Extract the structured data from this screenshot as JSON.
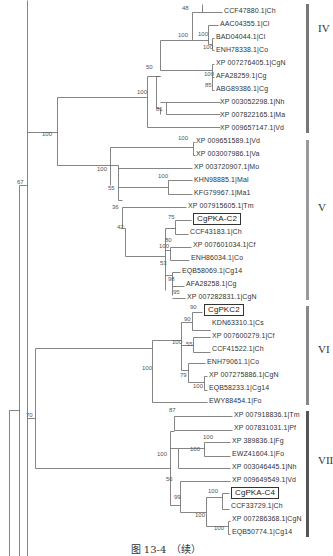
{
  "figure": {
    "caption": "图 13-4　（续）",
    "line_color": "#666666"
  },
  "leaves": [
    {
      "label": "CCF47880.1|Ch",
      "x": 224,
      "y": 10
    },
    {
      "label": "AAC04355.1|Cl",
      "x": 220,
      "y": 23
    },
    {
      "label": "BAD04044.1|Cl",
      "x": 216,
      "y": 36
    },
    {
      "label": "ENH78338.1|Co",
      "x": 216,
      "y": 49
    },
    {
      "label": "XP 007276405.1|CgN",
      "x": 216,
      "y": 62
    },
    {
      "label": "AFA28259.1|Cg",
      "x": 216,
      "y": 75
    },
    {
      "label": "ABG89386.1|Cg",
      "x": 216,
      "y": 88
    },
    {
      "label": "XP 003052298.1|Nh",
      "x": 220,
      "y": 101
    },
    {
      "label": "XP 007822165.1|Ma",
      "x": 220,
      "y": 114
    },
    {
      "label": "XP 009657147.1|Vd",
      "x": 220,
      "y": 127
    },
    {
      "label": "XP 009651589.1|Vd",
      "x": 196,
      "y": 140
    },
    {
      "label": "XP 003007986.1|Va",
      "x": 196,
      "y": 153
    },
    {
      "label": "XP 003720907.1|Mo",
      "x": 194,
      "y": 166
    },
    {
      "label": "KHN98885.1|Mal",
      "x": 194,
      "y": 179
    },
    {
      "label": "KFG79967.1|Ma1",
      "x": 194,
      "y": 192
    },
    {
      "label": "XP 007915605.1|Tm",
      "x": 188,
      "y": 205
    },
    {
      "label": "CgPKA-C2",
      "x": 193,
      "y": 217,
      "boxed": true
    },
    {
      "label": "CCF43183.1|Ch",
      "x": 190,
      "y": 231
    },
    {
      "label": "XP 007601034.1|Cf",
      "x": 193,
      "y": 244
    },
    {
      "label": "ENH86034.1|Co",
      "x": 191,
      "y": 257
    },
    {
      "label": "EQB58069.1|Cg14",
      "x": 182,
      "y": 270
    },
    {
      "label": "AFA28258.1|Cg",
      "x": 186,
      "y": 283
    },
    {
      "label": "XP 007282831.1|CgN",
      "x": 187,
      "y": 296
    },
    {
      "label": "CgPKC2",
      "x": 204,
      "y": 308,
      "boxed": true
    },
    {
      "label": "KDN63310.1|Cs",
      "x": 212,
      "y": 322
    },
    {
      "label": "XP 007600279.1|Cf",
      "x": 212,
      "y": 335
    },
    {
      "label": "CCF41522.1|Ch",
      "x": 212,
      "y": 348
    },
    {
      "label": "ENH79061.1|Co",
      "x": 207,
      "y": 361
    },
    {
      "label": "XP 007275886.1|CgN",
      "x": 209,
      "y": 374
    },
    {
      "label": "EQB58233.1|Cg14",
      "x": 209,
      "y": 387
    },
    {
      "label": "EWY88454.1|Fo",
      "x": 209,
      "y": 400
    },
    {
      "label": "XP 007918836.1|Tm",
      "x": 234,
      "y": 414
    },
    {
      "label": "XP 007831031.1|Pf",
      "x": 234,
      "y": 427
    },
    {
      "label": "XP 389836.1|Fg",
      "x": 232,
      "y": 440
    },
    {
      "label": "EWZ41604.1|Fo",
      "x": 232,
      "y": 453
    },
    {
      "label": "XP 003046445.1|Nh",
      "x": 232,
      "y": 466
    },
    {
      "label": "XP 009649549.1|Vd",
      "x": 232,
      "y": 479
    },
    {
      "label": "CgPKA-C4",
      "x": 231,
      "y": 491,
      "boxed": true
    },
    {
      "label": "CCF33729.1|Ch",
      "x": 231,
      "y": 505
    },
    {
      "label": "XP 007286368.1|CgN",
      "x": 232,
      "y": 518
    },
    {
      "label": "EQB50774.1|Cg14",
      "x": 232,
      "y": 531
    }
  ],
  "supports": [
    {
      "value": "48",
      "x": 182,
      "y": 11
    },
    {
      "value": "100",
      "x": 198,
      "y": 37
    },
    {
      "value": "100",
      "x": 178,
      "y": 38
    },
    {
      "value": "100",
      "x": 203,
      "y": 50
    },
    {
      "value": "50",
      "x": 146,
      "y": 70
    },
    {
      "value": "100",
      "x": 204,
      "y": 77
    },
    {
      "value": "85",
      "x": 205,
      "y": 88
    },
    {
      "value": "100",
      "x": 137,
      "y": 95
    },
    {
      "value": "81",
      "x": 156,
      "y": 112
    },
    {
      "value": "100",
      "x": 42,
      "y": 137
    },
    {
      "value": "100",
      "x": 178,
      "y": 141
    },
    {
      "value": "100",
      "x": 97,
      "y": 172
    },
    {
      "value": "100",
      "x": 158,
      "y": 179
    },
    {
      "value": "55",
      "x": 108,
      "y": 191
    },
    {
      "value": "67",
      "x": 17,
      "y": 185
    },
    {
      "value": "36",
      "x": 112,
      "y": 210
    },
    {
      "value": "75",
      "x": 168,
      "y": 220
    },
    {
      "value": "42",
      "x": 117,
      "y": 230
    },
    {
      "value": "80",
      "x": 165,
      "y": 243
    },
    {
      "value": "100",
      "x": 159,
      "y": 249
    },
    {
      "value": "53",
      "x": 160,
      "y": 266
    },
    {
      "value": "98",
      "x": 168,
      "y": 282
    },
    {
      "value": "95",
      "x": 173,
      "y": 295
    },
    {
      "value": "90",
      "x": 190,
      "y": 310
    },
    {
      "value": "90",
      "x": 184,
      "y": 322
    },
    {
      "value": "100",
      "x": 172,
      "y": 345
    },
    {
      "value": "55",
      "x": 186,
      "y": 347
    },
    {
      "value": "100",
      "x": 142,
      "y": 371
    },
    {
      "value": "79",
      "x": 180,
      "y": 378
    },
    {
      "value": "100",
      "x": 193,
      "y": 389
    },
    {
      "value": "70",
      "x": 26,
      "y": 418
    },
    {
      "value": "87",
      "x": 169,
      "y": 413
    },
    {
      "value": "100",
      "x": 203,
      "y": 440
    },
    {
      "value": "100",
      "x": 190,
      "y": 452
    },
    {
      "value": "100",
      "x": 157,
      "y": 457
    },
    {
      "value": "56",
      "x": 166,
      "y": 482
    },
    {
      "value": "100",
      "x": 208,
      "y": 494
    },
    {
      "value": "99",
      "x": 174,
      "y": 500
    },
    {
      "value": "100",
      "x": 195,
      "y": 518
    },
    {
      "value": "100",
      "x": 214,
      "y": 531
    }
  ],
  "clades": [
    {
      "label": "IV",
      "y_top": 4,
      "y_bottom": 133,
      "label_y": 28,
      "color": "#777777"
    },
    {
      "label": "V",
      "y_top": 140,
      "y_bottom": 300,
      "label_y": 207,
      "color": "#999999"
    },
    {
      "label": "VI",
      "y_top": 306,
      "y_bottom": 405,
      "label_y": 349,
      "color": "#888888"
    },
    {
      "label": "VII",
      "y_top": 411,
      "y_bottom": 537,
      "label_y": 460,
      "color": "#555555"
    }
  ],
  "branches": [
    [
      27,
      0,
      27,
      556
    ],
    [
      27,
      0,
      27,
      0
    ],
    [
      19,
      185,
      19,
      556
    ],
    [
      19,
      185,
      27,
      185
    ],
    [
      9,
      410,
      9,
      556
    ],
    [
      9,
      410,
      19,
      410
    ],
    [
      27,
      132,
      57,
      132
    ],
    [
      57,
      97,
      57,
      165
    ],
    [
      57,
      97,
      147,
      97
    ],
    [
      57,
      165,
      110,
      165
    ],
    [
      147,
      76,
      147,
      127
    ],
    [
      147,
      127,
      220,
      127
    ],
    [
      147,
      76,
      160,
      76
    ],
    [
      160,
      108,
      160,
      114
    ],
    [
      156,
      108,
      160,
      108
    ],
    [
      160,
      102,
      166,
      102
    ],
    [
      166,
      102,
      166,
      114
    ],
    [
      166,
      102,
      220,
      102
    ],
    [
      166,
      114,
      220,
      114
    ],
    [
      156,
      76,
      156,
      108
    ],
    [
      160,
      40,
      160,
      70
    ],
    [
      156,
      76,
      160,
      76
    ],
    [
      160,
      40,
      192,
      40
    ],
    [
      160,
      70,
      212,
      70
    ],
    [
      192,
      12,
      192,
      40
    ],
    [
      192,
      12,
      202,
      12
    ],
    [
      202,
      4,
      202,
      12
    ],
    [
      202,
      12,
      222,
      12
    ],
    [
      192,
      40,
      208,
      40
    ],
    [
      208,
      25,
      208,
      44
    ],
    [
      208,
      25,
      218,
      25
    ],
    [
      208,
      44,
      212,
      44
    ],
    [
      212,
      38,
      212,
      50
    ],
    [
      212,
      38,
      214,
      38
    ],
    [
      212,
      50,
      214,
      50
    ],
    [
      212,
      64,
      212,
      90
    ],
    [
      212,
      64,
      214,
      64
    ],
    [
      212,
      77,
      214,
      77
    ],
    [
      212,
      90,
      214,
      90
    ],
    [
      110,
      147,
      110,
      185
    ],
    [
      110,
      147,
      193,
      147
    ],
    [
      193,
      142,
      193,
      155
    ],
    [
      193,
      142,
      195,
      142
    ],
    [
      193,
      155,
      195,
      155
    ],
    [
      110,
      165,
      118,
      165
    ],
    [
      118,
      165,
      118,
      200
    ],
    [
      118,
      168,
      192,
      168
    ],
    [
      118,
      187,
      168,
      187
    ],
    [
      168,
      180,
      168,
      194
    ],
    [
      168,
      180,
      192,
      180
    ],
    [
      168,
      194,
      192,
      194
    ],
    [
      118,
      200,
      122,
      200
    ],
    [
      122,
      207,
      122,
      228
    ],
    [
      122,
      207,
      186,
      207
    ],
    [
      122,
      228,
      125,
      228
    ],
    [
      125,
      228,
      125,
      256
    ],
    [
      125,
      256,
      165,
      256
    ],
    [
      165,
      228,
      165,
      290
    ],
    [
      165,
      228,
      175,
      228
    ],
    [
      175,
      220,
      175,
      234
    ],
    [
      175,
      220,
      191,
      220
    ],
    [
      175,
      234,
      188,
      234
    ],
    [
      165,
      250,
      170,
      250
    ],
    [
      170,
      247,
      170,
      260
    ],
    [
      170,
      247,
      191,
      247
    ],
    [
      170,
      260,
      189,
      260
    ],
    [
      165,
      275,
      172,
      275
    ],
    [
      172,
      272,
      172,
      295
    ],
    [
      172,
      272,
      180,
      272
    ],
    [
      172,
      286,
      184,
      286
    ],
    [
      172,
      298,
      185,
      298
    ],
    [
      27,
      418,
      35,
      418
    ],
    [
      35,
      348,
      35,
      468
    ],
    [
      35,
      348,
      152,
      348
    ],
    [
      35,
      468,
      170,
      468
    ],
    [
      152,
      340,
      152,
      402
    ],
    [
      152,
      402,
      207,
      402
    ],
    [
      152,
      340,
      181,
      340
    ],
    [
      181,
      322,
      181,
      370
    ],
    [
      181,
      322,
      192,
      322
    ],
    [
      192,
      312,
      192,
      330
    ],
    [
      192,
      312,
      202,
      312
    ],
    [
      192,
      330,
      210,
      330
    ],
    [
      181,
      345,
      193,
      345
    ],
    [
      193,
      337,
      193,
      352
    ],
    [
      193,
      337,
      210,
      337
    ],
    [
      193,
      352,
      210,
      352
    ],
    [
      181,
      370,
      188,
      370
    ],
    [
      188,
      363,
      188,
      382
    ],
    [
      188,
      363,
      205,
      363
    ],
    [
      188,
      382,
      204,
      382
    ],
    [
      204,
      376,
      204,
      390
    ],
    [
      204,
      376,
      207,
      376
    ],
    [
      204,
      390,
      207,
      390
    ],
    [
      170,
      431,
      170,
      505
    ],
    [
      170,
      431,
      174,
      431
    ],
    [
      174,
      416,
      174,
      430
    ],
    [
      174,
      416,
      232,
      416
    ],
    [
      174,
      430,
      232,
      430
    ],
    [
      170,
      448,
      178,
      448
    ],
    [
      178,
      448,
      178,
      468
    ],
    [
      178,
      448,
      204,
      448
    ],
    [
      204,
      442,
      204,
      456
    ],
    [
      204,
      442,
      230,
      442
    ],
    [
      204,
      456,
      230,
      456
    ],
    [
      178,
      468,
      230,
      468
    ],
    [
      170,
      505,
      180,
      505
    ],
    [
      180,
      481,
      180,
      512
    ],
    [
      180,
      481,
      230,
      481
    ],
    [
      180,
      512,
      206,
      512
    ],
    [
      206,
      497,
      206,
      526
    ],
    [
      206,
      497,
      222,
      497
    ],
    [
      222,
      493,
      222,
      509
    ],
    [
      222,
      493,
      229,
      493
    ],
    [
      222,
      509,
      229,
      509
    ],
    [
      206,
      526,
      228,
      526
    ],
    [
      228,
      521,
      228,
      534
    ],
    [
      228,
      521,
      230,
      521
    ],
    [
      228,
      534,
      230,
      534
    ]
  ]
}
